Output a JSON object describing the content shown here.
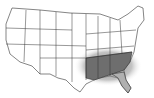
{
  "map": {
    "subject": "Contiguous United States outline map",
    "highlight_description": "Southeastern states shaded dark gray with soft gradient halo",
    "colors": {
      "background": "#ffffff",
      "border": "#333333",
      "state_fill": "#ffffff",
      "highlight_dark": "#6e6e6e",
      "highlight_light": "#b0b0b0"
    },
    "highlighted_regions": [
      "Texas (east)",
      "Oklahoma (east)",
      "Arkansas",
      "Louisiana",
      "Mississippi",
      "Alabama",
      "Georgia",
      "Florida",
      "South Carolina",
      "Tennessee",
      "North Carolina",
      "Kentucky (south)",
      "Missouri (south)"
    ]
  }
}
